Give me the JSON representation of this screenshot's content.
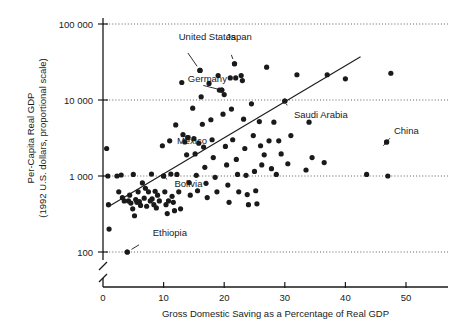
{
  "chart_data": {
    "type": "scatter",
    "title": "",
    "xlabel": "Gross Domestic Saving as a Percentage of Real GDP",
    "ylabel_line1": "Per-Capita Real GDP",
    "ylabel_line2": "(1992 U.S. dollars, proportional scale)",
    "xlim": [
      0,
      55
    ],
    "ylim_log": [
      100,
      100000
    ],
    "y_scale": "log",
    "y_axis_broken": true,
    "grid": "horizontal-dotted",
    "legend": "none",
    "x_ticks": [
      0,
      10,
      20,
      30,
      40,
      50
    ],
    "x_tick_labels": [
      "0",
      "10",
      "20",
      "30",
      "40",
      "50"
    ],
    "y_ticks": [
      100,
      1000,
      10000,
      100000
    ],
    "y_tick_labels": [
      "100",
      "1 000",
      "10 000",
      "100 000"
    ],
    "trend_line": {
      "x_start": 0.8,
      "y_start": 390,
      "x_end": 42.5,
      "y_end": 37000
    },
    "annotations": [
      {
        "label": "United States",
        "x": 16.0,
        "y": 24500,
        "label_x": 12.5,
        "label_y": 62000
      },
      {
        "label": "Japan",
        "x": 21.7,
        "y": 30000,
        "label_x": 20.3,
        "label_y": 62000
      },
      {
        "label": "Germany",
        "x": 19.6,
        "y": 13500,
        "label_x": 14.0,
        "label_y": 17500
      },
      {
        "label": "Saudi Arabia",
        "x": 30.0,
        "y": 9700,
        "label_x": 31.5,
        "label_y": 5800
      },
      {
        "label": "China",
        "x": 46.8,
        "y": 2800,
        "label_x": 48.0,
        "label_y": 3600
      },
      {
        "label": "Mexico",
        "x": 14.0,
        "y": 3200,
        "label_x": 12.2,
        "label_y": 2600
      },
      {
        "label": "Bolivia",
        "x": 10.0,
        "y": 1000,
        "label_x": 11.8,
        "label_y": 720
      },
      {
        "label": "Ethiopia",
        "x": 4.0,
        "y": 100,
        "label_x": 8.2,
        "label_y": 160
      }
    ],
    "points": [
      {
        "x": 0.6,
        "y": 2300
      },
      {
        "x": 0.8,
        "y": 1000
      },
      {
        "x": 0.9,
        "y": 420
      },
      {
        "x": 1.0,
        "y": 200
      },
      {
        "x": 2.3,
        "y": 1000
      },
      {
        "x": 2.6,
        "y": 620
      },
      {
        "x": 3.0,
        "y": 1030
      },
      {
        "x": 3.2,
        "y": 520
      },
      {
        "x": 3.5,
        "y": 470
      },
      {
        "x": 4.0,
        "y": 100
      },
      {
        "x": 4.2,
        "y": 470
      },
      {
        "x": 4.4,
        "y": 560
      },
      {
        "x": 4.6,
        "y": 440
      },
      {
        "x": 4.9,
        "y": 370
      },
      {
        "x": 5.0,
        "y": 1050
      },
      {
        "x": 5.2,
        "y": 300
      },
      {
        "x": 5.4,
        "y": 490
      },
      {
        "x": 5.6,
        "y": 450
      },
      {
        "x": 5.8,
        "y": 620
      },
      {
        "x": 6.0,
        "y": 460
      },
      {
        "x": 6.2,
        "y": 410
      },
      {
        "x": 6.5,
        "y": 810
      },
      {
        "x": 6.8,
        "y": 510
      },
      {
        "x": 7.0,
        "y": 690
      },
      {
        "x": 7.2,
        "y": 400
      },
      {
        "x": 7.5,
        "y": 620
      },
      {
        "x": 7.8,
        "y": 470
      },
      {
        "x": 8.0,
        "y": 1060
      },
      {
        "x": 8.1,
        "y": 500
      },
      {
        "x": 8.4,
        "y": 420
      },
      {
        "x": 8.6,
        "y": 630
      },
      {
        "x": 8.8,
        "y": 380
      },
      {
        "x": 9.0,
        "y": 560
      },
      {
        "x": 9.3,
        "y": 470
      },
      {
        "x": 9.8,
        "y": 2500
      },
      {
        "x": 10.0,
        "y": 1000
      },
      {
        "x": 10.2,
        "y": 620
      },
      {
        "x": 10.4,
        "y": 420
      },
      {
        "x": 10.6,
        "y": 320
      },
      {
        "x": 10.8,
        "y": 470
      },
      {
        "x": 11.0,
        "y": 2900
      },
      {
        "x": 11.2,
        "y": 1060
      },
      {
        "x": 11.4,
        "y": 540
      },
      {
        "x": 11.6,
        "y": 450
      },
      {
        "x": 11.8,
        "y": 350
      },
      {
        "x": 12.0,
        "y": 4700
      },
      {
        "x": 12.2,
        "y": 1050
      },
      {
        "x": 12.5,
        "y": 620
      },
      {
        "x": 12.8,
        "y": 370
      },
      {
        "x": 13.0,
        "y": 17000
      },
      {
        "x": 13.2,
        "y": 3500
      },
      {
        "x": 13.5,
        "y": 2800
      },
      {
        "x": 13.8,
        "y": 1900
      },
      {
        "x": 14.0,
        "y": 3200
      },
      {
        "x": 14.2,
        "y": 820
      },
      {
        "x": 14.4,
        "y": 560
      },
      {
        "x": 14.8,
        "y": 7800
      },
      {
        "x": 15.0,
        "y": 3100
      },
      {
        "x": 15.2,
        "y": 1950
      },
      {
        "x": 15.4,
        "y": 1020
      },
      {
        "x": 15.6,
        "y": 640
      },
      {
        "x": 15.8,
        "y": 2700
      },
      {
        "x": 16.0,
        "y": 24500
      },
      {
        "x": 16.2,
        "y": 11000
      },
      {
        "x": 16.4,
        "y": 4800
      },
      {
        "x": 16.6,
        "y": 2400
      },
      {
        "x": 16.8,
        "y": 1300
      },
      {
        "x": 17.0,
        "y": 800
      },
      {
        "x": 17.2,
        "y": 520
      },
      {
        "x": 17.5,
        "y": 16500
      },
      {
        "x": 17.8,
        "y": 5500
      },
      {
        "x": 18.0,
        "y": 3000
      },
      {
        "x": 18.2,
        "y": 1750
      },
      {
        "x": 18.5,
        "y": 960
      },
      {
        "x": 18.8,
        "y": 620
      },
      {
        "x": 19.0,
        "y": 21000
      },
      {
        "x": 19.2,
        "y": 13500
      },
      {
        "x": 19.6,
        "y": 13500
      },
      {
        "x": 19.8,
        "y": 6500
      },
      {
        "x": 20.0,
        "y": 11800
      },
      {
        "x": 20.2,
        "y": 2450
      },
      {
        "x": 20.4,
        "y": 1400
      },
      {
        "x": 20.6,
        "y": 760
      },
      {
        "x": 20.8,
        "y": 450
      },
      {
        "x": 21.0,
        "y": 19500
      },
      {
        "x": 21.2,
        "y": 7600
      },
      {
        "x": 21.4,
        "y": 3000
      },
      {
        "x": 21.7,
        "y": 30000
      },
      {
        "x": 21.9,
        "y": 19500
      },
      {
        "x": 22.0,
        "y": 1650
      },
      {
        "x": 22.2,
        "y": 1050
      },
      {
        "x": 22.4,
        "y": 620
      },
      {
        "x": 22.8,
        "y": 21000
      },
      {
        "x": 23.0,
        "y": 18000
      },
      {
        "x": 23.2,
        "y": 5600
      },
      {
        "x": 23.4,
        "y": 2300
      },
      {
        "x": 23.6,
        "y": 1020
      },
      {
        "x": 23.8,
        "y": 570
      },
      {
        "x": 24.0,
        "y": 420
      },
      {
        "x": 24.5,
        "y": 8900
      },
      {
        "x": 24.8,
        "y": 3400
      },
      {
        "x": 25.0,
        "y": 1150
      },
      {
        "x": 25.2,
        "y": 640
      },
      {
        "x": 25.4,
        "y": 430
      },
      {
        "x": 25.8,
        "y": 5200
      },
      {
        "x": 26.0,
        "y": 2500
      },
      {
        "x": 26.2,
        "y": 1400
      },
      {
        "x": 26.6,
        "y": 1900
      },
      {
        "x": 27.0,
        "y": 27000
      },
      {
        "x": 27.4,
        "y": 2900
      },
      {
        "x": 27.8,
        "y": 1250
      },
      {
        "x": 28.2,
        "y": 5100
      },
      {
        "x": 28.6,
        "y": 1050
      },
      {
        "x": 29.0,
        "y": 2900
      },
      {
        "x": 29.4,
        "y": 1950
      },
      {
        "x": 30.0,
        "y": 9700
      },
      {
        "x": 30.5,
        "y": 1450
      },
      {
        "x": 31.0,
        "y": 3400
      },
      {
        "x": 32.0,
        "y": 21500
      },
      {
        "x": 33.5,
        "y": 1200
      },
      {
        "x": 34.0,
        "y": 5100
      },
      {
        "x": 34.5,
        "y": 1750
      },
      {
        "x": 36.5,
        "y": 1500
      },
      {
        "x": 37.0,
        "y": 21500
      },
      {
        "x": 40.0,
        "y": 19000
      },
      {
        "x": 43.5,
        "y": 1050
      },
      {
        "x": 46.8,
        "y": 2800
      },
      {
        "x": 47.0,
        "y": 1000
      },
      {
        "x": 47.5,
        "y": 22500
      }
    ]
  }
}
